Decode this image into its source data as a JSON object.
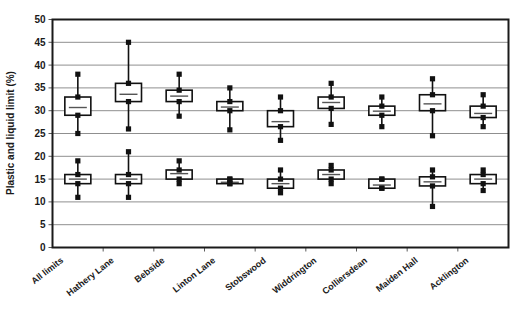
{
  "chart_data": {
    "type": "box",
    "title": "",
    "subtitle": "",
    "xlabel": "",
    "ylabel": "Plastic and liquid limit (%)",
    "ylim": [
      0,
      50
    ],
    "ytick_step": 5,
    "yticks": [
      "0",
      "5",
      "10",
      "15",
      "20",
      "25",
      "30",
      "35",
      "40",
      "45",
      "50"
    ],
    "grid": true,
    "grid_axis": "y",
    "legend": "none",
    "categories": [
      "All limits",
      "Hathery Lane",
      "Bebside",
      "Linton Lane",
      "Stobswood",
      "Widdrington",
      "Colliersdean",
      "Maiden Hall",
      "Acklington"
    ],
    "series": [
      {
        "name": "Liquid limit",
        "group": "upper",
        "boxes": [
          {
            "category": "All limits",
            "min": 25.0,
            "q1": 29.0,
            "median": 30.7,
            "q3": 33.0,
            "max": 38.0
          },
          {
            "category": "Hathery Lane",
            "min": 26.0,
            "q1": 32.0,
            "median": 33.6,
            "q3": 36.0,
            "max": 45.0
          },
          {
            "category": "Bebside",
            "min": 28.8,
            "q1": 32.0,
            "median": 33.2,
            "q3": 34.5,
            "max": 38.0
          },
          {
            "category": "Linton Lane",
            "min": 25.8,
            "q1": 30.0,
            "median": 30.8,
            "q3": 32.0,
            "max": 35.0
          },
          {
            "category": "Stobswood",
            "min": 23.5,
            "q1": 26.5,
            "median": 27.6,
            "q3": 30.0,
            "max": 33.0
          },
          {
            "category": "Widdrington",
            "min": 27.0,
            "q1": 30.5,
            "median": 31.8,
            "q3": 33.0,
            "max": 36.0
          },
          {
            "category": "Colliersdean",
            "min": 26.5,
            "q1": 29.0,
            "median": 29.9,
            "q3": 31.0,
            "max": 33.0
          },
          {
            "category": "Maiden Hall",
            "min": 24.5,
            "q1": 30.0,
            "median": 31.5,
            "q3": 33.5,
            "max": 37.0
          },
          {
            "category": "Acklington",
            "min": 26.5,
            "q1": 28.5,
            "median": 29.4,
            "q3": 31.0,
            "max": 33.5
          }
        ]
      },
      {
        "name": "Plastic limit",
        "group": "lower",
        "boxes": [
          {
            "category": "All limits",
            "min": 11.0,
            "q1": 14.0,
            "median": 15.0,
            "q3": 16.0,
            "max": 19.0
          },
          {
            "category": "Hathery Lane",
            "min": 11.0,
            "q1": 14.0,
            "median": 15.0,
            "q3": 16.0,
            "max": 21.0
          },
          {
            "category": "Bebside",
            "min": 14.0,
            "q1": 15.0,
            "median": 16.2,
            "q3": 17.0,
            "max": 19.0
          },
          {
            "category": "Linton Lane",
            "min": 14.0,
            "q1": 14.0,
            "median": 14.3,
            "q3": 15.0,
            "max": 15.0
          },
          {
            "category": "Stobswood",
            "min": 12.0,
            "q1": 13.0,
            "median": 14.0,
            "q3": 15.0,
            "max": 17.0
          },
          {
            "category": "Widdrington",
            "min": 14.0,
            "q1": 15.0,
            "median": 16.0,
            "q3": 17.0,
            "max": 18.0
          },
          {
            "category": "Colliersdean",
            "min": 13.0,
            "q1": 13.0,
            "median": 13.7,
            "q3": 15.0,
            "max": 15.0
          },
          {
            "category": "Maiden Hall",
            "min": 9.0,
            "q1": 13.5,
            "median": 14.4,
            "q3": 15.5,
            "max": 17.0
          },
          {
            "category": "Acklington",
            "min": 12.5,
            "q1": 14.0,
            "median": 15.0,
            "q3": 16.0,
            "max": 17.0
          }
        ]
      }
    ]
  }
}
